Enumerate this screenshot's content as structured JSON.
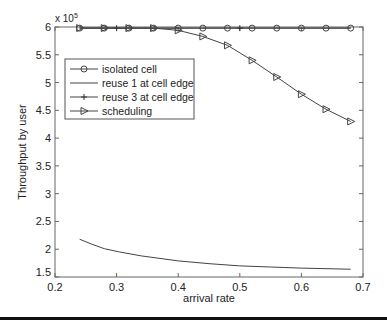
{
  "chart_data": {
    "type": "line",
    "title": "",
    "xlabel": "arrival rate",
    "ylabel": "Throughput by user",
    "y_multiplier_label": "x 10",
    "y_multiplier_exp": "5",
    "xlim": [
      0.2,
      0.7
    ],
    "ylim": [
      1.5,
      6
    ],
    "xticks": [
      0.2,
      0.3,
      0.4,
      0.5,
      0.6,
      0.7
    ],
    "xtick_labels": [
      "0.2",
      "0.3",
      "0.4",
      "0.5",
      "0.6",
      "0.7"
    ],
    "yticks": [
      1.5,
      2,
      2.5,
      3,
      3.5,
      4,
      4.5,
      5,
      5.5,
      6
    ],
    "ytick_labels": [
      "1.5",
      "2",
      "2.5",
      "3",
      "3.5",
      "4",
      "4.5",
      "5",
      "5.5",
      "6"
    ],
    "grid": false,
    "legend_position": "upper-left",
    "series": [
      {
        "name": "isolated cell",
        "marker": "circle",
        "x": [
          0.24,
          0.28,
          0.32,
          0.36,
          0.4,
          0.44,
          0.48,
          0.52,
          0.56,
          0.6,
          0.64,
          0.68
        ],
        "y": [
          5.98,
          5.98,
          5.98,
          5.98,
          5.98,
          5.98,
          5.98,
          5.98,
          5.98,
          5.98,
          5.98,
          5.98
        ]
      },
      {
        "name": "reuse 1 at cell edge",
        "marker": "none",
        "x": [
          0.24,
          0.26,
          0.28,
          0.305,
          0.34,
          0.4,
          0.45,
          0.5,
          0.55,
          0.6,
          0.68
        ],
        "y": [
          2.18,
          2.09,
          2.01,
          1.95,
          1.88,
          1.79,
          1.74,
          1.7,
          1.68,
          1.66,
          1.64
        ]
      },
      {
        "name": "reuse 3 at cell edge",
        "marker": "plus",
        "x": [
          0.24,
          0.3,
          0.5,
          0.68
        ],
        "y": [
          5.98,
          5.98,
          5.98,
          5.98
        ],
        "marker_x": [
          0.3,
          0.5
        ]
      },
      {
        "name": "scheduling",
        "marker": "triangle-right",
        "x": [
          0.24,
          0.28,
          0.32,
          0.36,
          0.4,
          0.44,
          0.48,
          0.52,
          0.56,
          0.6,
          0.64,
          0.68
        ],
        "y": [
          5.98,
          5.98,
          5.98,
          5.98,
          5.94,
          5.83,
          5.67,
          5.4,
          5.1,
          4.79,
          4.52,
          4.3
        ]
      }
    ]
  }
}
